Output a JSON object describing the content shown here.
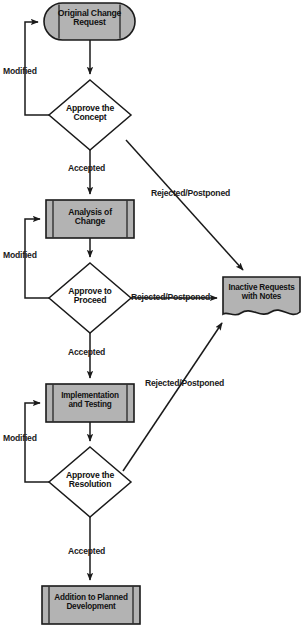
{
  "diagram": {
    "type": "flowchart",
    "colors": {
      "fill": "#b3b3b3",
      "stroke": "#1a1a1a",
      "text": "#111111",
      "background": "#ffffff"
    },
    "nodes": [
      {
        "id": "original-change-request",
        "shape": "terminator",
        "line1": "Original Change",
        "line2": "Request"
      },
      {
        "id": "approve-the-concept",
        "shape": "decision",
        "line1": "Approve the",
        "line2": "Concept"
      },
      {
        "id": "analysis-of-change",
        "shape": "predefined-process",
        "line1": "Analysis of",
        "line2": "Change"
      },
      {
        "id": "approve-to-proceed",
        "shape": "decision",
        "line1": "Approve to",
        "line2": "Proceed"
      },
      {
        "id": "implementation-and-testing",
        "shape": "predefined-process",
        "line1": "Implementation",
        "line2": "and Testing"
      },
      {
        "id": "approve-the-resolution",
        "shape": "decision",
        "line1": "Approve the",
        "line2": "Resolution"
      },
      {
        "id": "addition-to-planned-development",
        "shape": "predefined-process",
        "line1": "Addition to Planned",
        "line2": "Development"
      },
      {
        "id": "inactive-requests-with-notes",
        "shape": "document",
        "line1": "Inactive Requests",
        "line2": "with Notes"
      }
    ],
    "edge_labels": {
      "modified_1": "Modified",
      "modified_2": "Modified",
      "modified_3": "Modified",
      "accepted_1": "Accepted",
      "accepted_2": "Accepted",
      "accepted_3": "Accepted",
      "rejected_1": "Rejected/Postponed",
      "rejected_2": "Rejected/Postponed",
      "rejected_3": "Rejected/Postponed"
    }
  }
}
